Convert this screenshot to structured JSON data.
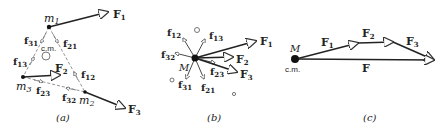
{
  "panels": {
    "a": {
      "caption": "(a)",
      "masses": [
        "m1",
        "m2",
        "m3"
      ],
      "mass_labels": {
        "m1": "m",
        "m1_sub": "1",
        "m2": "m",
        "m2_sub": "2",
        "m3": "m",
        "m3_sub": "3"
      },
      "cm_label": "c.m.",
      "external_forces": {
        "F1": "F",
        "F1_sub": "1",
        "F2": "F",
        "F2_sub": "2",
        "F3": "F",
        "F3_sub": "3"
      },
      "internal_forces": {
        "f31": "f",
        "f31_sub": "31",
        "f21": "f",
        "f21_sub": "21",
        "f13": "f",
        "f13_sub": "13",
        "f12": "f",
        "f12_sub": "12",
        "f23": "f",
        "f23_sub": "23",
        "f32": "f",
        "f32_sub": "32"
      }
    },
    "b": {
      "caption": "(b)",
      "mass_label": "M",
      "external_forces": {
        "F1": "F",
        "F1_sub": "1",
        "F2": "F",
        "F2_sub": "2",
        "F3": "F",
        "F3_sub": "3"
      },
      "internal_forces": {
        "f12": "f",
        "f12_sub": "12",
        "f13": "f",
        "f13_sub": "13",
        "f32": "f",
        "f32_sub": "32",
        "f23": "f",
        "f23_sub": "23",
        "f31": "f",
        "f31_sub": "31",
        "f21": "f",
        "f21_sub": "21"
      }
    },
    "c": {
      "caption": "(c)",
      "mass_label": "M",
      "cm_label": "c.m.",
      "forces": {
        "F1": "F",
        "F1_sub": "1",
        "F2": "F",
        "F2_sub": "2",
        "F3": "F",
        "F3_sub": "3",
        "F": "F"
      }
    }
  }
}
